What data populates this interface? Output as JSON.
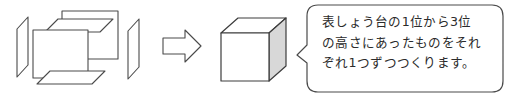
{
  "figure": {
    "colors": {
      "stroke": "#4a4a4a",
      "face_fill": "#ffffff",
      "shaded_face": "#d8d8d8",
      "text": "#2b2b2b",
      "background": "#ffffff"
    },
    "exploded_cube": {
      "label": "exploded cube faces",
      "faces": [
        {
          "name": "left-face",
          "shape": "parallelogram"
        },
        {
          "name": "top-face",
          "shape": "parallelogram"
        },
        {
          "name": "back-face",
          "shape": "square"
        },
        {
          "name": "front-face",
          "shape": "square"
        },
        {
          "name": "bottom-face",
          "shape": "parallelogram"
        },
        {
          "name": "right-face",
          "shape": "parallelogram"
        }
      ]
    },
    "arrow": {
      "name": "right-arrow",
      "direction": "right"
    },
    "assembled_cube": {
      "name": "assembled-cube",
      "faces": [
        "top",
        "front",
        "right"
      ]
    }
  },
  "speech_bubble": {
    "name": "speech-bubble",
    "tail_direction": "left",
    "lines": [
      "表しょう台の1位から3位",
      "の高さにあったものをそれ",
      "ぞれ1つずつつくります。"
    ]
  }
}
